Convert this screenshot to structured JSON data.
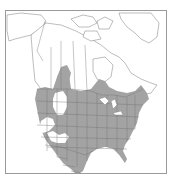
{
  "map": {
    "type": "range-map",
    "region": "North America",
    "colors": {
      "background": "#ffffff",
      "range_fill": "#a3a3a3",
      "boundary_line": "#6e6e6e",
      "frame": "#9a9a9a",
      "exclusion": "#ffffff"
    },
    "legend": [],
    "labels": []
  }
}
